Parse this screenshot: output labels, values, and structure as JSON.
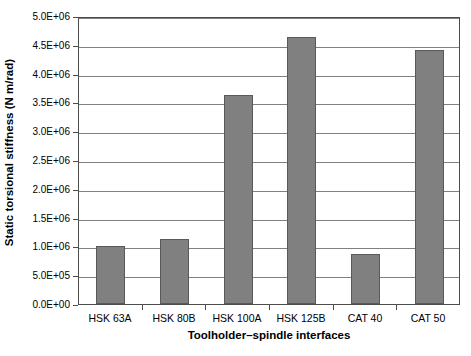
{
  "chart_data": {
    "type": "bar",
    "title": "",
    "subtitle": "",
    "xlabel": "Toolholder–spindle interfaces",
    "ylabel": "Static torsional stiffness (N m/rad)",
    "categories": [
      "HSK 63A",
      "HSK 80B",
      "HSK 100A",
      "HSK 125B",
      "CAT 40",
      "CAT 50"
    ],
    "values": [
      1000000,
      1130000,
      3630000,
      4640000,
      870000,
      4410000
    ],
    "value_labels": [
      "1.00E+06",
      "1.13E+06",
      "3.63E+06",
      "4.64E+06",
      "8.70E+05",
      "4.41E+06"
    ],
    "ylim": [
      0,
      5000000
    ],
    "ytick_values": [
      0,
      500000,
      1000000,
      1500000,
      2000000,
      2500000,
      3000000,
      3500000,
      4000000,
      4500000,
      5000000
    ],
    "ytick_labels": [
      "0.0E+00",
      "5.0E+05",
      "1.0E+06",
      "1.5E+06",
      "2.0E+06",
      "2.5E+06",
      "3.0E+06",
      "3.5E+06",
      "4.0E+06",
      "4.5E+06",
      "5.0E+06"
    ],
    "grid": true,
    "grid_axis": "y",
    "legend": false,
    "legend_position": "none",
    "series": [
      {
        "name": "Static torsional stiffness",
        "values": [
          1000000,
          1130000,
          3630000,
          4640000,
          870000,
          4410000
        ]
      }
    ],
    "colors": {
      "bar_fill": "#808080",
      "bar_edge": "#595959",
      "gridline": "#808080",
      "axis": "#4d4d4d",
      "plot_background": "#ffffff",
      "figure_background": "#ffffff",
      "text": "#000000"
    }
  }
}
